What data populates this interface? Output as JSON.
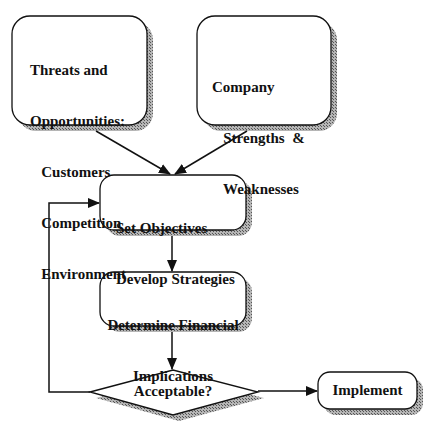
{
  "diagram": {
    "nodes": {
      "threats": {
        "lines": [
          "Threats and",
          "Opportunities:",
          "   Customers",
          "   Competition",
          "   Environment"
        ]
      },
      "company": {
        "lines": [
          "Company",
          "   Strengths  &",
          "   Weaknesses"
        ]
      },
      "objectives": {
        "lines": [
          "Set Objectives",
          "Develop Strategies"
        ]
      },
      "financial": {
        "lines": [
          "Determine Financial",
          "Implications"
        ]
      },
      "decision": {
        "label": "Acceptable?"
      },
      "implement": {
        "label": "Implement"
      }
    },
    "edges": [
      {
        "from": "threats",
        "to": "objectives"
      },
      {
        "from": "company",
        "to": "objectives"
      },
      {
        "from": "objectives",
        "to": "financial"
      },
      {
        "from": "financial",
        "to": "decision"
      },
      {
        "from": "decision",
        "to": "implement"
      },
      {
        "from": "decision",
        "to": "objectives",
        "type": "feedback-loop"
      }
    ],
    "colors": {
      "stroke": "#111111",
      "shadow": "#8a8a8a",
      "fill": "#ffffff"
    }
  }
}
